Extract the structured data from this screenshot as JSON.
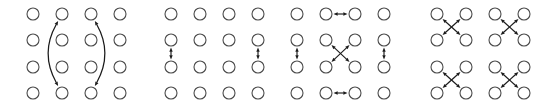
{
  "figure": {
    "width": 552,
    "height": 112,
    "background": "#ffffff",
    "node": {
      "radius": 6,
      "stroke_color": "#4a4a4a",
      "fill_color": "#ffffff",
      "stroke_width": 1.1
    },
    "arrow": {
      "color": "#1a1a1a",
      "stroke_width": 1.15,
      "head_length": 4.2,
      "head_width": 3.4
    },
    "grid": {
      "rows": 4,
      "cols": 4,
      "col_spacing": 29,
      "row_spacing": 26.3,
      "first_row_y": 14
    }
  },
  "panels": [
    {
      "id": "panel-1",
      "name": "long-range-vertical-coupling",
      "origin_x": 33,
      "cols_x": [
        33,
        62,
        91,
        120
      ],
      "rows_y": [
        14,
        40,
        67,
        93
      ],
      "arrows": {
        "curved": [
          {
            "name": "curved-arrow-column-2",
            "from_col": 1,
            "from_row": 3,
            "to_col": 1,
            "to_row": 0,
            "bulge": -11,
            "double_headed": true
          },
          {
            "name": "curved-arrow-column-3",
            "from_col": 2,
            "from_row": 3,
            "to_col": 2,
            "to_row": 0,
            "bulge": 11,
            "double_headed": true
          }
        ],
        "straight": [],
        "diagonal": []
      }
    },
    {
      "id": "panel-2",
      "name": "short-range-vertical-coupling",
      "origin_x": 171,
      "cols_x": [
        171,
        200,
        229,
        258
      ],
      "rows_y": [
        14,
        40,
        67,
        93
      ],
      "arrows": {
        "curved": [],
        "straight": [
          {
            "name": "vertical-arrow-col-1",
            "col": 0,
            "from_row": 1,
            "to_row": 2,
            "orientation": "vertical",
            "double_headed": true
          },
          {
            "name": "vertical-arrow-col-4",
            "col": 3,
            "from_row": 1,
            "to_row": 2,
            "orientation": "vertical",
            "double_headed": true
          }
        ],
        "diagonal": []
      }
    },
    {
      "id": "panel-3",
      "name": "mixed-plaquette-coupling",
      "origin_x": 297,
      "cols_x": [
        297,
        326,
        355,
        384
      ],
      "rows_y": [
        14,
        40,
        67,
        93
      ],
      "arrows": {
        "curved": [],
        "straight": [
          {
            "name": "horizontal-arrow-row-1",
            "row": 0,
            "from_col": 1,
            "to_col": 2,
            "orientation": "horizontal",
            "double_headed": true
          },
          {
            "name": "horizontal-arrow-row-4",
            "row": 3,
            "from_col": 1,
            "to_col": 2,
            "orientation": "horizontal",
            "double_headed": true
          },
          {
            "name": "vertical-arrow-col-1",
            "col": 0,
            "from_row": 1,
            "to_row": 2,
            "orientation": "vertical",
            "double_headed": true
          },
          {
            "name": "vertical-arrow-col-4",
            "col": 3,
            "from_row": 1,
            "to_row": 2,
            "orientation": "vertical",
            "double_headed": true
          }
        ],
        "diagonal": [
          {
            "name": "diagonal-cross-center",
            "top_left_col": 1,
            "top_left_row": 1,
            "double_headed": true
          }
        ]
      }
    },
    {
      "id": "panel-4",
      "name": "four-plaquette-diagonal-coupling",
      "origin_x": 437,
      "cols_x": [
        437,
        466,
        495,
        524
      ],
      "rows_y": [
        14,
        40,
        67,
        93
      ],
      "arrows": {
        "curved": [],
        "straight": [],
        "diagonal": [
          {
            "name": "diagonal-cross-top-left",
            "top_left_col": 0,
            "top_left_row": 0,
            "double_headed": true
          },
          {
            "name": "diagonal-cross-top-right",
            "top_left_col": 2,
            "top_left_row": 0,
            "double_headed": true
          },
          {
            "name": "diagonal-cross-bottom-left",
            "top_left_col": 0,
            "top_left_row": 2,
            "double_headed": true
          },
          {
            "name": "diagonal-cross-bottom-right",
            "top_left_col": 2,
            "top_left_row": 2,
            "double_headed": true
          }
        ]
      }
    }
  ]
}
